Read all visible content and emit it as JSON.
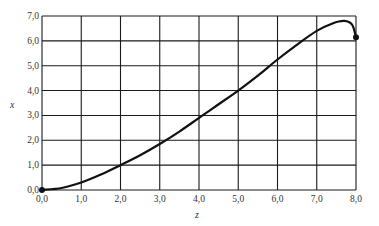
{
  "chart_data": {
    "type": "line",
    "title": "",
    "xlabel": "z",
    "ylabel": "x",
    "xlim": [
      0,
      8
    ],
    "ylim": [
      0,
      7
    ],
    "grid": true,
    "legend": null,
    "x_ticks": [
      "0,0",
      "1,0",
      "2,0",
      "3,0",
      "4,0",
      "5,0",
      "6,0",
      "7,0",
      "8,0"
    ],
    "y_ticks": [
      "0,0",
      "1,0",
      "2,0",
      "3,0",
      "4,0",
      "5,0",
      "6,0",
      "7,0"
    ],
    "series": [
      {
        "name": "x(z)",
        "color": "#111111",
        "points": [
          [
            0.0,
            0.0
          ],
          [
            0.5,
            0.08
          ],
          [
            1.0,
            0.3
          ],
          [
            1.5,
            0.62
          ],
          [
            2.0,
            1.0
          ],
          [
            2.5,
            1.4
          ],
          [
            3.0,
            1.85
          ],
          [
            3.5,
            2.35
          ],
          [
            4.0,
            2.9
          ],
          [
            4.5,
            3.45
          ],
          [
            5.0,
            4.0
          ],
          [
            5.5,
            4.6
          ],
          [
            6.0,
            5.25
          ],
          [
            6.5,
            5.85
          ],
          [
            7.0,
            6.4
          ],
          [
            7.4,
            6.7
          ],
          [
            7.7,
            6.8
          ],
          [
            7.9,
            6.65
          ],
          [
            8.0,
            6.15
          ]
        ],
        "markers": [
          [
            0.0,
            0.0
          ],
          [
            8.0,
            6.15
          ]
        ]
      }
    ]
  }
}
